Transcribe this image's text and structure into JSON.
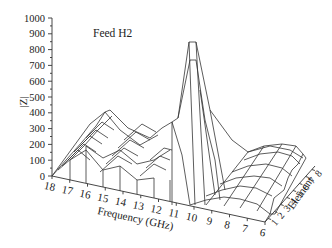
{
  "chart_data": {
    "type": "surface3d",
    "title": "Feed H2",
    "xlabel": "Frequency (GHz)",
    "ylabel": "|Z|",
    "zlabel": "Element",
    "y_ticks": [
      "0",
      "100",
      "200",
      "300",
      "400",
      "500",
      "600",
      "700",
      "800",
      "900",
      "1000"
    ],
    "ylim": [
      0,
      1000
    ],
    "frequency_ticks": [
      "18",
      "17",
      "16",
      "15",
      "14",
      "13",
      "12",
      "11",
      "10",
      "9",
      "8",
      "7",
      "6"
    ],
    "element_ticks": [
      "1",
      "2",
      "3",
      "4",
      "5",
      "6",
      "7",
      "8"
    ],
    "frequencies": [
      18,
      17,
      16,
      15,
      14,
      13,
      12,
      11,
      10,
      9,
      8,
      7,
      6
    ],
    "elements": [
      1,
      2,
      3,
      4,
      5,
      6,
      7,
      8
    ],
    "surface_approx": {
      "description": "Approximate |Z| per frequency along front (element 1) and back (element 8) edges",
      "element_1": [
        0,
        100,
        20,
        40,
        40,
        100,
        20,
        330,
        0,
        20,
        40,
        0,
        0
      ],
      "element_8": [
        300,
        350,
        420,
        330,
        250,
        250,
        300,
        340,
        850,
        200,
        250,
        250,
        200
      ],
      "peak": {
        "frequency": 10.5,
        "value": 850
      }
    },
    "grid": false,
    "legend": null
  }
}
